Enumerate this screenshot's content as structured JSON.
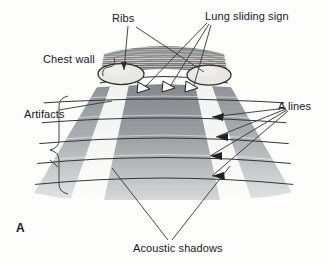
{
  "figure": {
    "panel_label": "A",
    "background_color": "#fdfdfc",
    "ink_color": "#17191a"
  },
  "labels": {
    "ribs": "Ribs",
    "lung_sliding_sign": "Lung sliding sign",
    "chest_wall": "Chest wall",
    "artifacts": "Artifacts",
    "a_lines": "A lines",
    "acoustic_shadows": "Acoustic shadows"
  },
  "diagram": {
    "type": "medical-illustration",
    "colors": {
      "chest_wall_hatch": "#6f7376",
      "rib_fill": "#e7e5e1",
      "rib_outline": "#2c2f31",
      "tissue_gray_dark": "#8d9195",
      "tissue_gray_mid": "#a4a8ab",
      "tissue_gray_light": "#c9cbcc",
      "shadow_column": "#f4f4f2",
      "a_line_stroke": "#2f3234",
      "leader_stroke": "#3a3d3f"
    },
    "structures": [
      {
        "name": "chest-wall-band",
        "description": "curved horizontally hatched band across top of sector"
      },
      {
        "name": "rib-left",
        "description": "light filled ellipse with dark outline, left"
      },
      {
        "name": "rib-right",
        "description": "light filled ellipse with dark outline, right"
      },
      {
        "name": "sector-fan",
        "description": "downward widening ultrasound sector divided into five radial columns"
      },
      {
        "name": "acoustic-shadow-column-left",
        "description": "pale vertical column descending beneath left rib"
      },
      {
        "name": "acoustic-shadow-column-right",
        "description": "pale vertical column descending beneath right rib"
      },
      {
        "name": "a-lines",
        "count": 6,
        "description": "repeating horizontal curved bright lines parallel to pleural line"
      },
      {
        "name": "sliding-arrowheads",
        "count": 3,
        "description": "hollow outlined arrowheads along the pleural line indicating lung sliding"
      }
    ],
    "leaders": {
      "ribs_arrow_count": 1,
      "lung_sliding_arrow_count": 3,
      "a_lines_arrow_count": 4,
      "acoustic_shadow_leader_count": 2,
      "chest_wall_brace": true,
      "artifacts_brace": true
    }
  }
}
